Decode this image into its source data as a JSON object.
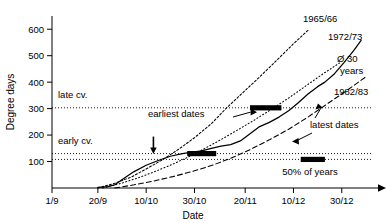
{
  "chart_data": {
    "type": "line",
    "title": "",
    "xlabel": "Date",
    "ylabel": "Degree days",
    "grid": false,
    "legend_position": "right-inline",
    "x_tick_labels": [
      "1/9",
      "20/9",
      "10/10",
      "30/10",
      "20/11",
      "10/12",
      "30/12"
    ],
    "x_tick_values": [
      0,
      19,
      39,
      59,
      80,
      100,
      120
    ],
    "y_tick_labels": [
      "100",
      "200",
      "300",
      "400",
      "500",
      "600"
    ],
    "y_tick_values": [
      100,
      200,
      300,
      400,
      500,
      600
    ],
    "xlim": [
      0,
      135
    ],
    "ylim": [
      0,
      650
    ],
    "series": [
      {
        "name": "1965/66",
        "style": "dotted-fine",
        "label": "1965/66",
        "points": [
          [
            19,
            0
          ],
          [
            26,
            18
          ],
          [
            33,
            42
          ],
          [
            39,
            72
          ],
          [
            46,
            108
          ],
          [
            53,
            150
          ],
          [
            59,
            190
          ],
          [
            66,
            243
          ],
          [
            72,
            300
          ],
          [
            79,
            360
          ],
          [
            86,
            420
          ],
          [
            93,
            482
          ],
          [
            100,
            545
          ],
          [
            106,
            596
          ]
        ]
      },
      {
        "name": "1972/73",
        "style": "solid",
        "label": "1972/73",
        "points": [
          [
            19,
            2
          ],
          [
            23,
            5
          ],
          [
            26,
            12
          ],
          [
            30,
            38
          ],
          [
            34,
            62
          ],
          [
            39,
            86
          ],
          [
            44,
            104
          ],
          [
            49,
            120
          ],
          [
            54,
            130
          ],
          [
            58,
            136
          ],
          [
            62,
            140
          ],
          [
            66,
            150
          ],
          [
            70,
            158
          ],
          [
            74,
            164
          ],
          [
            78,
            178
          ],
          [
            82,
            205
          ],
          [
            86,
            232
          ],
          [
            90,
            248
          ],
          [
            94,
            268
          ],
          [
            98,
            292
          ],
          [
            102,
            322
          ],
          [
            106,
            355
          ],
          [
            110,
            383
          ],
          [
            113,
            400
          ],
          [
            117,
            432
          ],
          [
            121,
            475
          ],
          [
            125,
            520
          ],
          [
            128,
            558
          ]
        ]
      },
      {
        "name": "Ø 30 years",
        "style": "dotted-coarse",
        "label": "Ø 30 years",
        "points": [
          [
            21,
            0
          ],
          [
            28,
            16
          ],
          [
            35,
            36
          ],
          [
            42,
            60
          ],
          [
            49,
            86
          ],
          [
            56,
            115
          ],
          [
            63,
            148
          ],
          [
            70,
            183
          ],
          [
            77,
            220
          ],
          [
            84,
            258
          ],
          [
            91,
            298
          ],
          [
            98,
            340
          ],
          [
            105,
            385
          ],
          [
            112,
            430
          ],
          [
            119,
            472
          ]
        ]
      },
      {
        "name": "1982/83",
        "style": "dashed",
        "label": "1982/83",
        "points": [
          [
            26,
            0
          ],
          [
            34,
            12
          ],
          [
            42,
            26
          ],
          [
            50,
            43
          ],
          [
            58,
            62
          ],
          [
            66,
            85
          ],
          [
            74,
            112
          ],
          [
            82,
            145
          ],
          [
            90,
            182
          ],
          [
            98,
            222
          ],
          [
            106,
            268
          ],
          [
            114,
            318
          ],
          [
            122,
            368
          ],
          [
            130,
            420
          ]
        ]
      }
    ],
    "threshold_lines": [
      {
        "label": "late cv.",
        "value": 303,
        "style": "dotted"
      },
      {
        "label": "early cv.",
        "value": 130,
        "style": "dotted"
      },
      {
        "label": "",
        "value": 108,
        "style": "dotted"
      }
    ],
    "range_bars": [
      {
        "name": "early-cv-range-bar",
        "y": 130,
        "x_start": 56,
        "x_end": 68
      },
      {
        "name": "late-cv-range-bar",
        "y": 303,
        "x_start": 82,
        "x_end": 95
      },
      {
        "name": "legend-range-bar",
        "y": 108,
        "x_start": 103,
        "x_end": 113
      }
    ],
    "annotations": [
      {
        "name": "earliest-dates",
        "text": "earliest dates"
      },
      {
        "name": "latest-dates",
        "text": "latest dates"
      },
      {
        "name": "fifty-percent-of-years",
        "text": "50% of years"
      }
    ],
    "markers": [
      {
        "name": "down-arrow-marker",
        "x": 42,
        "y": 130
      }
    ],
    "colors": {
      "axis": "#000000",
      "series": "#000000",
      "threshold": "#000000",
      "bar": "#000000",
      "background": "#ffffff"
    }
  }
}
